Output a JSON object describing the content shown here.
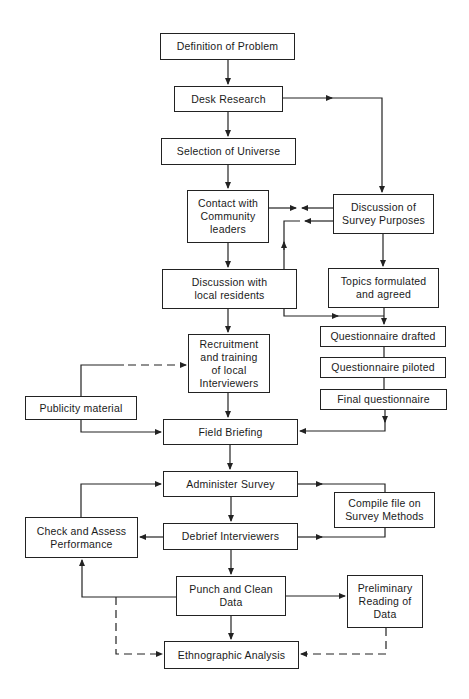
{
  "diagram": {
    "type": "flowchart",
    "nodes": [
      {
        "id": "definition",
        "label": "Definition of Problem",
        "box": [
          160,
          33,
          135,
          27
        ]
      },
      {
        "id": "desk",
        "label": "Desk Research",
        "box": [
          174,
          86,
          109,
          26
        ]
      },
      {
        "id": "selection",
        "label": "Selection of Universe",
        "box": [
          161,
          138,
          135,
          27
        ]
      },
      {
        "id": "contact",
        "label": "Contact with\nCommunity\nleaders",
        "box": [
          187,
          190,
          82,
          53
        ]
      },
      {
        "id": "purposes",
        "label": "Discussion of\nSurvey Purposes",
        "box": [
          333,
          194,
          101,
          40
        ]
      },
      {
        "id": "residents",
        "label": "Discussion with\nlocal residents",
        "box": [
          162,
          269,
          135,
          40
        ]
      },
      {
        "id": "topics",
        "label": "Topics formulated\nand agreed",
        "box": [
          328,
          268,
          111,
          40
        ]
      },
      {
        "id": "drafted",
        "label": "Questionnaire drafted",
        "box": [
          320,
          326,
          126,
          21
        ]
      },
      {
        "id": "piloted",
        "label": "Questionnaire piloted",
        "box": [
          320,
          357,
          126,
          21
        ]
      },
      {
        "id": "final",
        "label": "Final questionnaire",
        "box": [
          320,
          389,
          127,
          21
        ]
      },
      {
        "id": "recruitment",
        "label": "Recruitment\nand training\nof local\nInterviewers",
        "box": [
          188,
          334,
          82,
          59
        ]
      },
      {
        "id": "publicity",
        "label": "Publicity material",
        "box": [
          25,
          396,
          112,
          24
        ]
      },
      {
        "id": "briefing",
        "label": "Field Briefing",
        "box": [
          163,
          419,
          135,
          26
        ]
      },
      {
        "id": "administer",
        "label": "Administer Survey",
        "box": [
          163,
          471,
          135,
          26
        ]
      },
      {
        "id": "compile",
        "label": "Compile file on\nSurvey Methods",
        "box": [
          334,
          492,
          101,
          36
        ]
      },
      {
        "id": "check",
        "label": "Check and Assess\nPerformance",
        "box": [
          25,
          517,
          113,
          41
        ]
      },
      {
        "id": "debrief",
        "label": "Debrief Interviewers",
        "box": [
          163,
          523,
          135,
          27
        ]
      },
      {
        "id": "punch",
        "label": "Punch and Clean\nData",
        "box": [
          176,
          576,
          110,
          40
        ]
      },
      {
        "id": "preliminary",
        "label": "Preliminary\nReading of\nData",
        "box": [
          347,
          575,
          76,
          53
        ]
      },
      {
        "id": "ethnographic",
        "label": "Ethnographic Analysis",
        "box": [
          164,
          641,
          135,
          28
        ]
      }
    ],
    "edges": [
      {
        "from": "definition",
        "to": "desk",
        "style": "solid"
      },
      {
        "from": "desk",
        "to": "selection",
        "style": "solid"
      },
      {
        "from": "desk",
        "to": "purposes",
        "style": "solid"
      },
      {
        "from": "selection",
        "to": "contact",
        "style": "solid"
      },
      {
        "from": "contact",
        "to": "purposes",
        "style": "solid",
        "note": "bidirectional"
      },
      {
        "from": "purposes",
        "to": "residents",
        "style": "solid",
        "note": "bidirectional"
      },
      {
        "from": "contact",
        "to": "residents",
        "style": "solid"
      },
      {
        "from": "purposes",
        "to": "topics",
        "style": "solid"
      },
      {
        "from": "residents",
        "to": "drafted",
        "style": "solid"
      },
      {
        "from": "topics",
        "to": "drafted",
        "style": "solid"
      },
      {
        "from": "drafted",
        "to": "piloted",
        "style": "solid"
      },
      {
        "from": "piloted",
        "to": "final",
        "style": "solid"
      },
      {
        "from": "residents",
        "to": "recruitment",
        "style": "solid"
      },
      {
        "from": "publicity",
        "to": "recruitment",
        "style": "dashed"
      },
      {
        "from": "publicity",
        "to": "briefing",
        "style": "solid"
      },
      {
        "from": "recruitment",
        "to": "briefing",
        "style": "solid"
      },
      {
        "from": "final",
        "to": "briefing",
        "style": "solid"
      },
      {
        "from": "briefing",
        "to": "administer",
        "style": "solid"
      },
      {
        "from": "administer",
        "to": "compile",
        "style": "solid"
      },
      {
        "from": "administer",
        "to": "debrief",
        "style": "solid"
      },
      {
        "from": "check",
        "to": "administer",
        "style": "solid"
      },
      {
        "from": "debrief",
        "to": "check",
        "style": "solid"
      },
      {
        "from": "debrief",
        "to": "compile",
        "style": "solid"
      },
      {
        "from": "debrief",
        "to": "punch",
        "style": "solid"
      },
      {
        "from": "punch",
        "to": "check",
        "style": "solid"
      },
      {
        "from": "punch",
        "to": "preliminary",
        "style": "solid"
      },
      {
        "from": "punch",
        "to": "ethnographic",
        "style": "solid"
      },
      {
        "from": "punch",
        "to": "ethnographic",
        "style": "dashed",
        "note": "via left loop"
      },
      {
        "from": "preliminary",
        "to": "ethnographic",
        "style": "dashed"
      }
    ]
  },
  "nodes": {
    "definition": "Definition of Problem",
    "desk": "Desk Research",
    "selection": "Selection of Universe",
    "contact": "Contact with\nCommunity\nleaders",
    "purposes": "Discussion of\nSurvey Purposes",
    "residents": "Discussion with\nlocal residents",
    "topics": "Topics formulated\nand agreed",
    "drafted": "Questionnaire drafted",
    "piloted": "Questionnaire piloted",
    "final": "Final questionnaire",
    "recruitment": "Recruitment\nand training\nof local\nInterviewers",
    "publicity": "Publicity material",
    "briefing": "Field Briefing",
    "administer": "Administer Survey",
    "compile": "Compile file on\nSurvey Methods",
    "check": "Check and Assess\nPerformance",
    "debrief": "Debrief Interviewers",
    "punch": "Punch and Clean\nData",
    "preliminary": "Preliminary\nReading of\nData",
    "ethnographic": "Ethnographic Analysis"
  }
}
